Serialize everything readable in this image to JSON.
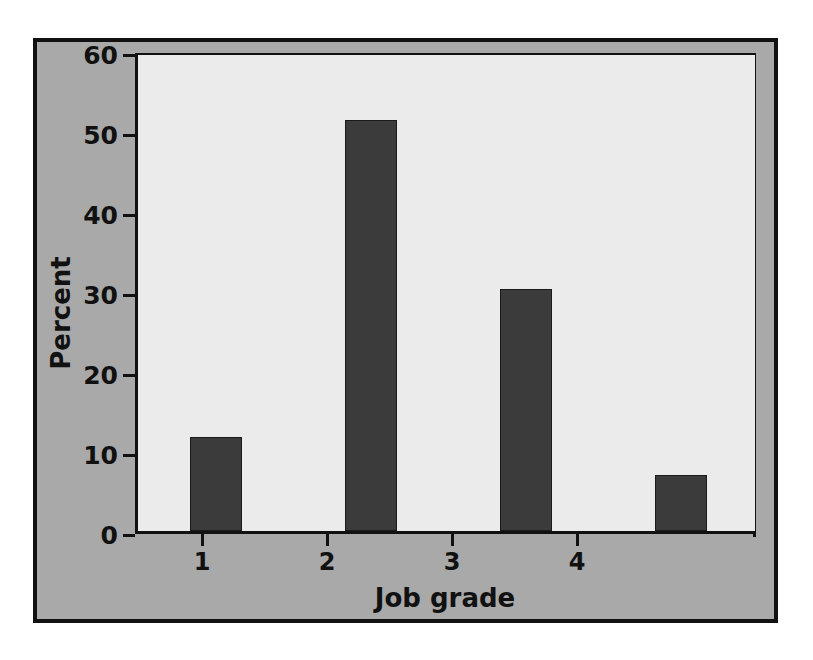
{
  "chart_data": {
    "type": "bar",
    "title": "",
    "subtitle": "",
    "xlabel": "Job grade",
    "ylabel": "Percent",
    "categories": [
      "1",
      "2",
      "3",
      "4"
    ],
    "values": [
      11.8,
      51.5,
      30.3,
      7.0
    ],
    "ylim": [
      0,
      60
    ],
    "yticks": [
      0,
      10,
      20,
      30,
      40,
      50,
      60
    ],
    "ytick_labels": [
      "0",
      "10",
      "20",
      "30",
      "40",
      "50",
      "60"
    ],
    "xtick_labels": [
      "1",
      "2",
      "3",
      "4"
    ],
    "grid": false,
    "legend": null,
    "annotations": [],
    "colors": {
      "bar_fill": "#3b3b3b",
      "bar_edge": "#1a1a1a",
      "plot_background": "#ebebeb",
      "figure_background": "#a9a9a9",
      "frame_border": "#111111",
      "text": "#111111",
      "page_background": "#ffffff"
    }
  }
}
